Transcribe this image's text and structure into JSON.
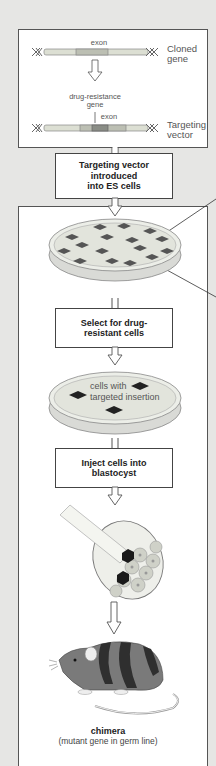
{
  "figure": {
    "top_panel": {
      "cloned_gene_exon_label": "exon",
      "cloned_gene_label_line1": "Cloned",
      "cloned_gene_label_line2": "gene",
      "drug_resistance_label_line1": "drug-resistance",
      "drug_resistance_label_line2": "gene",
      "targeting_exon_label": "exon",
      "targeting_vector_label_line1": "Targeting",
      "targeting_vector_label_line2": "vector"
    },
    "steps": [
      {
        "lines": [
          "Targeting vector",
          "introduced",
          "into ES cells"
        ]
      },
      {
        "lines": [
          "Select for drug-",
          "resistant cells"
        ]
      },
      {
        "lines": [
          "Inject cells into",
          "blastocyst"
        ]
      }
    ],
    "dish2_label_line1": "cells with",
    "dish2_label_line2": "targeted insertion",
    "chimera_title": "chimera",
    "chimera_subtitle": "(mutant gene in germ line)"
  },
  "colors": {
    "background": "#e6e6e4",
    "panel_border": "#555555",
    "gene_bar": "#d8dbcf",
    "exon": "#b9bcb0",
    "drug_resistance": "#8a8d86",
    "colony": "#555555",
    "mouse_body": "#7a7a7a",
    "mouse_stripes": "#2f2f2f"
  }
}
